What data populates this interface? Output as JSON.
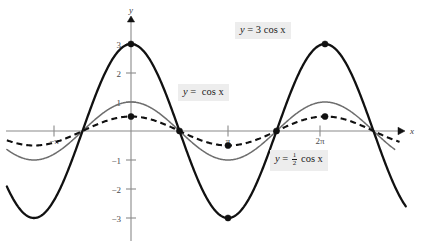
{
  "figure": {
    "title": "",
    "axis_labels": {
      "x": "x",
      "y": "y"
    }
  },
  "labels": {
    "three_cos": {
      "lhs": "y",
      "eq": "=",
      "rhs": "3 cos x"
    },
    "cos": {
      "lhs": "y",
      "eq": "=",
      "rhs": "cos x"
    },
    "half_cos": {
      "lhs": "y",
      "eq": "=",
      "num": "1",
      "den": "2",
      "rhs": "cos x"
    }
  },
  "ticks": {
    "x": [
      {
        "label": "−π",
        "value": -3.14159
      },
      {
        "label": "π",
        "value": 3.14159
      },
      {
        "label": "2π",
        "value": 6.28319
      }
    ],
    "y": [
      {
        "label": "3",
        "value": 3
      },
      {
        "label": "2",
        "value": 2
      },
      {
        "label": "1",
        "value": 1
      },
      {
        "label": "−1",
        "value": -1
      },
      {
        "label": "−2",
        "value": -2
      },
      {
        "label": "−3",
        "value": -3
      }
    ]
  },
  "colors": {
    "axis": "#8a8a8a",
    "thick_curve": "#111111",
    "thin_curve": "#6d6d6d",
    "dashed_curve": "#111111",
    "label_background": "#ededed",
    "page_background": "#ffffff"
  },
  "chart_data": {
    "type": "line",
    "title": "",
    "xlabel": "x",
    "ylabel": "y",
    "xlim": [
      -4.3,
      9.3
    ],
    "ylim": [
      -3.6,
      3.4
    ],
    "grid": false,
    "legend": "inline-annotations",
    "x_tick_labels": [
      "−π",
      "π",
      "2π"
    ],
    "x_tick_values": [
      -3.14159,
      3.14159,
      6.28319
    ],
    "y_tick_labels": [
      "3",
      "2",
      "1",
      "−1",
      "−2",
      "−3"
    ],
    "y_tick_values": [
      3,
      2,
      1,
      -1,
      -2,
      -3
    ],
    "series": [
      {
        "name": "y = 3 cos x",
        "style": "solid-thick",
        "color": "#111111",
        "amplitude": 3,
        "formula": "3*cos(x)",
        "points": [
          {
            "x": -3.14159,
            "y": -3
          },
          {
            "x": -1.5708,
            "y": 0
          },
          {
            "x": 0,
            "y": 3
          },
          {
            "x": 1.5708,
            "y": 0
          },
          {
            "x": 3.14159,
            "y": -3
          },
          {
            "x": 4.71239,
            "y": 0
          },
          {
            "x": 6.28319,
            "y": 3
          },
          {
            "x": 7.85398,
            "y": 0
          }
        ]
      },
      {
        "name": "y = cos x",
        "style": "solid-thin",
        "color": "#6d6d6d",
        "amplitude": 1,
        "formula": "cos(x)",
        "points": [
          {
            "x": -3.14159,
            "y": -1
          },
          {
            "x": -1.5708,
            "y": 0
          },
          {
            "x": 0,
            "y": 1
          },
          {
            "x": 1.5708,
            "y": 0
          },
          {
            "x": 3.14159,
            "y": -1
          },
          {
            "x": 4.71239,
            "y": 0
          },
          {
            "x": 6.28319,
            "y": 1
          },
          {
            "x": 7.85398,
            "y": 0
          }
        ]
      },
      {
        "name": "y = 1/2 cos x",
        "style": "dashed",
        "color": "#111111",
        "amplitude": 0.5,
        "formula": "0.5*cos(x)",
        "points": [
          {
            "x": -3.14159,
            "y": -0.5
          },
          {
            "x": -1.5708,
            "y": 0
          },
          {
            "x": 0,
            "y": 0.5
          },
          {
            "x": 1.5708,
            "y": 0
          },
          {
            "x": 3.14159,
            "y": -0.5
          },
          {
            "x": 4.71239,
            "y": 0
          },
          {
            "x": 6.28319,
            "y": 0.5
          },
          {
            "x": 7.85398,
            "y": 0
          }
        ]
      }
    ],
    "marked_points": [
      {
        "x": 0,
        "y": 3,
        "series": "y = 3 cos x"
      },
      {
        "x": 0,
        "y": 0.5,
        "series": "y = 1/2 cos x"
      },
      {
        "x": 1.5708,
        "y": 0,
        "series": "all"
      },
      {
        "x": 3.14159,
        "y": -3,
        "series": "y = 3 cos x"
      },
      {
        "x": 3.14159,
        "y": -0.5,
        "series": "y = 1/2 cos x"
      },
      {
        "x": 4.71239,
        "y": 0,
        "series": "all"
      },
      {
        "x": 6.28319,
        "y": 3,
        "series": "y = 3 cos x"
      },
      {
        "x": 6.28319,
        "y": 0.5,
        "series": "y = 1/2 cos x"
      }
    ]
  }
}
